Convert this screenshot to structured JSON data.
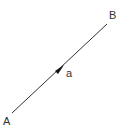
{
  "diagram": {
    "type": "vector",
    "start_point": {
      "label": "A",
      "x": 12,
      "y": 113
    },
    "end_point": {
      "label": "B",
      "x": 107,
      "y": 24
    },
    "vector_label": "a",
    "colors": {
      "line": "#333333",
      "text": "#333333",
      "background": "#ffffff"
    }
  }
}
